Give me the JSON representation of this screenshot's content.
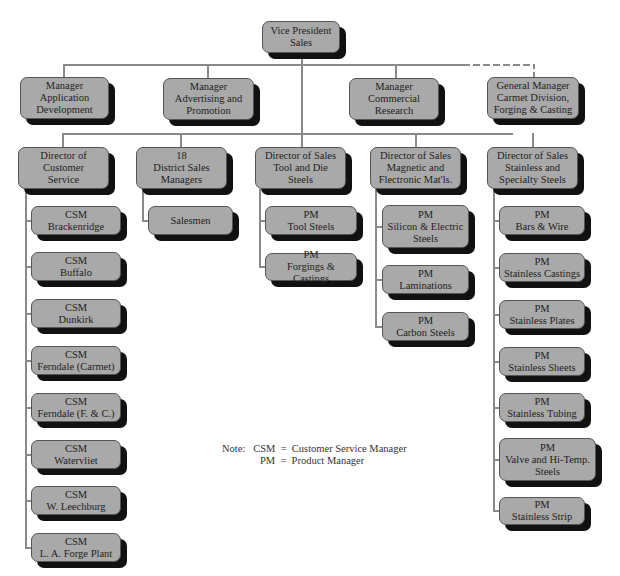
{
  "top": {
    "vp": {
      "label": "Vice President\nSales",
      "x": 262,
      "y": 21,
      "w": 78,
      "h": 32
    }
  },
  "staff": [
    {
      "label": "Manager\nApplication\nDevelopment",
      "x": 20,
      "y": 77,
      "w": 89,
      "h": 42
    },
    {
      "label": "Manager\nAdvertising and\nPromotion",
      "x": 163,
      "y": 78,
      "w": 91,
      "h": 42
    },
    {
      "label": "Manager\nCommercial\nResearch",
      "x": 349,
      "y": 78,
      "w": 90,
      "h": 42
    },
    {
      "label": "General Manager\nCarmet Division,\nForging & Casting",
      "x": 487,
      "y": 77,
      "w": 92,
      "h": 42
    }
  ],
  "directors": [
    {
      "label": "Director of\nCustomer\nService",
      "x": 18,
      "y": 147,
      "w": 91,
      "h": 42,
      "children": [
        "CSM\nBrackenridge",
        "CSM\nBuffalo",
        "CSM\nDunkirk",
        "CSM\nFerndale (Carmet)",
        "CSM\nFerndale (F. & C.)",
        "CSM\nWatervliet",
        "CSM\nW. Leechburg",
        "CSM\nL. A. Forge Plant"
      ]
    },
    {
      "label": "18\nDistrict Sales\nManagers",
      "x": 136,
      "y": 147,
      "w": 91,
      "h": 42,
      "children": [
        "Salesmen"
      ]
    },
    {
      "label": "Director of Sales\nTool and Die\nSteels",
      "x": 255,
      "y": 147,
      "w": 91,
      "h": 42,
      "children": [
        "PM\nTool Steels",
        "PM\nForgings & Castings"
      ]
    },
    {
      "label": "Director of Sales\nMagnetic and\nFlectronic Mat'ls.",
      "x": 370,
      "y": 147,
      "w": 91,
      "h": 42,
      "children": [
        "PM\nSilicon & Electric\nSteels",
        "PM\nLaminations",
        "PM\nCarbon Steels"
      ]
    },
    {
      "label": "Director of Sales\nStainless and\nSpecialty Steels",
      "x": 487,
      "y": 147,
      "w": 91,
      "h": 42,
      "children": [
        "PM\nBars & Wire",
        "PM\nStainless Castings",
        "PM\nStainless Plates",
        "PM\nStainless Sheets",
        "PM\nStainless Tubing",
        "PM\nValve and Hi-Temp.\nSteels",
        "PM\nStainless Strip"
      ]
    }
  ],
  "subboxes": [
    {
      "label": "CSM\nBrackenridge",
      "x": 31,
      "y": 206,
      "w": 90,
      "h": 29
    },
    {
      "label": "CSM\nBuffalo",
      "x": 31,
      "y": 252,
      "w": 90,
      "h": 29
    },
    {
      "label": "CSM\nDunkirk",
      "x": 31,
      "y": 299,
      "w": 90,
      "h": 29
    },
    {
      "label": "CSM\nFerndale (Carmet)",
      "x": 31,
      "y": 346,
      "w": 90,
      "h": 29
    },
    {
      "label": "CSM\nFerndale (F. & C.)",
      "x": 31,
      "y": 393,
      "w": 90,
      "h": 29
    },
    {
      "label": "CSM\nWatervliet",
      "x": 31,
      "y": 440,
      "w": 90,
      "h": 29
    },
    {
      "label": "CSM\nW. Leechburg",
      "x": 31,
      "y": 486,
      "w": 90,
      "h": 29
    },
    {
      "label": "CSM\nL. A. Forge Plant",
      "x": 31,
      "y": 533,
      "w": 90,
      "h": 29
    },
    {
      "label": "Salesmen",
      "x": 148,
      "y": 206,
      "w": 85,
      "h": 29
    },
    {
      "label": "PM\nTool Steels",
      "x": 265,
      "y": 206,
      "w": 92,
      "h": 29
    },
    {
      "label": "PM\nForgings & Castings",
      "x": 265,
      "y": 253,
      "w": 92,
      "h": 28
    },
    {
      "label": "PM\nSilicon & Electric\nSteels",
      "x": 382,
      "y": 205,
      "w": 87,
      "h": 43
    },
    {
      "label": "PM\nLaminations",
      "x": 382,
      "y": 265,
      "w": 87,
      "h": 29
    },
    {
      "label": "PM\nCarbon Steels",
      "x": 382,
      "y": 312,
      "w": 87,
      "h": 29
    },
    {
      "label": "PM\nBars & Wire",
      "x": 499,
      "y": 206,
      "w": 86,
      "h": 29
    },
    {
      "label": "PM\nStainless Castings",
      "x": 499,
      "y": 253,
      "w": 86,
      "h": 29
    },
    {
      "label": "PM\nStainless Plates",
      "x": 499,
      "y": 300,
      "w": 86,
      "h": 29
    },
    {
      "label": "PM\nStainless Sheets",
      "x": 499,
      "y": 347,
      "w": 86,
      "h": 29
    },
    {
      "label": "PM\nStainless Tubing",
      "x": 499,
      "y": 393,
      "w": 86,
      "h": 29
    },
    {
      "label": "PM\nValve and Hi-Temp.\nSteels",
      "x": 499,
      "y": 438,
      "w": 97,
      "h": 43
    },
    {
      "label": "PM\nStainless Strip",
      "x": 499,
      "y": 497,
      "w": 86,
      "h": 28
    }
  ],
  "lines": [
    {
      "x": 301,
      "y": 53,
      "w": 2,
      "h": 82
    },
    {
      "x": 63,
      "y": 64,
      "w": 400,
      "h": 2
    },
    {
      "x": 63,
      "y": 64,
      "w": 2,
      "h": 14
    },
    {
      "x": 207,
      "y": 64,
      "w": 2,
      "h": 14
    },
    {
      "x": 395,
      "y": 64,
      "w": 2,
      "h": 14
    },
    {
      "x": 62,
      "y": 133,
      "w": 451,
      "h": 2
    },
    {
      "x": 62,
      "y": 133,
      "w": 2,
      "h": 14
    },
    {
      "x": 180,
      "y": 133,
      "w": 2,
      "h": 14
    },
    {
      "x": 301,
      "y": 133,
      "w": 2,
      "h": 14
    },
    {
      "x": 415,
      "y": 133,
      "w": 2,
      "h": 14
    },
    {
      "x": 532,
      "y": 133,
      "w": 2,
      "h": 14
    },
    {
      "x": 25,
      "y": 189,
      "w": 2,
      "h": 360
    },
    {
      "x": 25,
      "y": 220,
      "w": 7,
      "h": 2
    },
    {
      "x": 25,
      "y": 266,
      "w": 7,
      "h": 2
    },
    {
      "x": 25,
      "y": 313,
      "w": 7,
      "h": 2
    },
    {
      "x": 25,
      "y": 360,
      "w": 7,
      "h": 2
    },
    {
      "x": 25,
      "y": 407,
      "w": 7,
      "h": 2
    },
    {
      "x": 25,
      "y": 454,
      "w": 7,
      "h": 2
    },
    {
      "x": 25,
      "y": 500,
      "w": 7,
      "h": 2
    },
    {
      "x": 25,
      "y": 547,
      "w": 7,
      "h": 2
    },
    {
      "x": 142,
      "y": 189,
      "w": 2,
      "h": 32
    },
    {
      "x": 142,
      "y": 220,
      "w": 7,
      "h": 2
    },
    {
      "x": 259,
      "y": 189,
      "w": 2,
      "h": 79
    },
    {
      "x": 259,
      "y": 220,
      "w": 7,
      "h": 2
    },
    {
      "x": 259,
      "y": 266,
      "w": 7,
      "h": 2
    },
    {
      "x": 375,
      "y": 189,
      "w": 2,
      "h": 138
    },
    {
      "x": 375,
      "y": 226,
      "w": 8,
      "h": 2
    },
    {
      "x": 375,
      "y": 279,
      "w": 8,
      "h": 2
    },
    {
      "x": 375,
      "y": 326,
      "w": 8,
      "h": 2
    },
    {
      "x": 493,
      "y": 189,
      "w": 2,
      "h": 322
    },
    {
      "x": 493,
      "y": 220,
      "w": 7,
      "h": 2
    },
    {
      "x": 493,
      "y": 267,
      "w": 7,
      "h": 2
    },
    {
      "x": 493,
      "y": 314,
      "w": 7,
      "h": 2
    },
    {
      "x": 493,
      "y": 361,
      "w": 7,
      "h": 2
    },
    {
      "x": 493,
      "y": 407,
      "w": 7,
      "h": 2
    },
    {
      "x": 493,
      "y": 459,
      "w": 7,
      "h": 2
    },
    {
      "x": 493,
      "y": 510,
      "w": 7,
      "h": 2
    }
  ],
  "dashed": [
    {
      "x": 463,
      "y": 64,
      "w": 72,
      "h": 2
    },
    {
      "x": 533,
      "y": 64,
      "w": 2,
      "h": 13
    }
  ],
  "note": {
    "line1": "Note:   CSM  =  Customer Service Manager",
    "line2": "PM  =  Product Manager",
    "x1": 222,
    "y1": 443,
    "x2": 260,
    "y2": 455
  },
  "colors": {
    "box_fill": "#a9a9a9",
    "shadow": "#111111",
    "line": "#8a8a8a"
  }
}
